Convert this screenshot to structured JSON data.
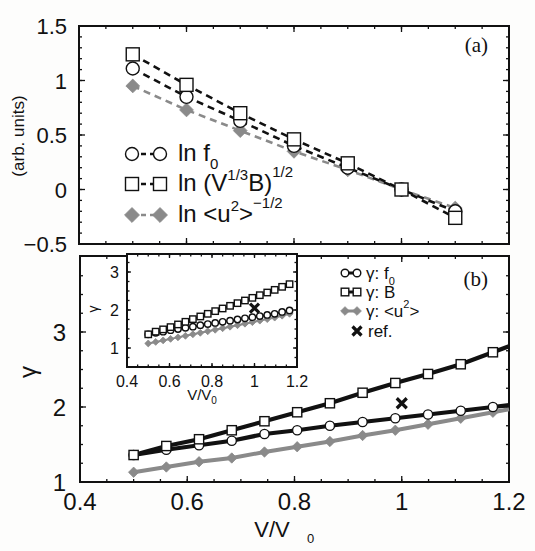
{
  "chart_data": [
    {
      "panel": "a",
      "type": "line",
      "panel_label": "(a)",
      "title": "",
      "xlabel": "",
      "ylabel": "(arb. units)",
      "xlim": [
        0.4,
        1.2
      ],
      "ylim": [
        -0.5,
        1.5
      ],
      "yticks": [
        -0.5,
        0,
        0.5,
        1,
        1.5
      ],
      "ytick_labels": [
        "−0.5",
        "0",
        "0.5",
        "1",
        "1.5"
      ],
      "xticks": [
        0.4,
        0.6,
        0.8,
        1.0,
        1.2
      ],
      "grid": false,
      "legend_position": "lower-left",
      "x": [
        0.5,
        0.6,
        0.7,
        0.8,
        0.9,
        1.0,
        1.1
      ],
      "series": [
        {
          "name": "ln f0",
          "legend": {
            "text": "ln f",
            "sub": "0",
            "sup": ""
          },
          "marker": "circle",
          "line": "dashed",
          "color": "#111111",
          "values": [
            1.11,
            0.85,
            0.63,
            0.4,
            0.2,
            0.0,
            -0.2
          ]
        },
        {
          "name": "ln (V^1/3 B)^1/2",
          "legend": {
            "text": "ln (V",
            "sup1": "1/3",
            "mid": "B)",
            "sup2": "1/2"
          },
          "marker": "square",
          "line": "dashed",
          "color": "#111111",
          "values": [
            1.24,
            0.96,
            0.7,
            0.46,
            0.24,
            0.0,
            -0.26
          ]
        },
        {
          "name": "ln <u^2>^-1/2",
          "legend": {
            "text": "ln <u",
            "sup1": "2",
            "mid": ">",
            "sup2": "−1/2"
          },
          "marker": "diamond",
          "line": "dashed",
          "color": "#8a8a8a",
          "values": [
            0.95,
            0.73,
            0.54,
            0.35,
            0.18,
            0.0,
            -0.17
          ]
        }
      ]
    },
    {
      "panel": "b",
      "type": "line",
      "panel_label": "(b)",
      "title": "",
      "xlabel": "V/V0",
      "xlabel_parts": {
        "main": "V/V",
        "sub": "0"
      },
      "ylabel": "γ",
      "xlim": [
        0.4,
        1.2
      ],
      "ylim": [
        1,
        4
      ],
      "xticks": [
        0.4,
        0.6,
        0.8,
        1,
        1.2
      ],
      "xtick_labels": [
        "0.4",
        "0.6",
        "0.8",
        "1",
        "1.2"
      ],
      "yticks": [
        1,
        2,
        3
      ],
      "ytick_labels": [
        "1",
        "2",
        "3"
      ],
      "grid": false,
      "legend_position": "upper-right",
      "x": [
        0.5,
        0.561,
        0.622,
        0.683,
        0.744,
        0.805,
        0.866,
        0.927,
        0.988,
        1.049,
        1.11,
        1.17
      ],
      "series": [
        {
          "name": "γ: f0",
          "legend": {
            "text": "γ: f",
            "sub": "0"
          },
          "marker": "circle",
          "line": "solid",
          "color": "#111111",
          "values": [
            1.36,
            1.43,
            1.49,
            1.55,
            1.64,
            1.69,
            1.75,
            1.8,
            1.85,
            1.9,
            1.95,
            2.0
          ]
        },
        {
          "name": "γ: B",
          "legend": {
            "text": "γ: B"
          },
          "marker": "square",
          "line": "solid",
          "color": "#111111",
          "values": [
            1.36,
            1.48,
            1.57,
            1.69,
            1.81,
            1.93,
            2.05,
            2.19,
            2.32,
            2.44,
            2.57,
            2.73
          ]
        },
        {
          "name": "γ: <u^2>",
          "legend": {
            "text": "γ: <u",
            "sup": "2",
            "tail": ">"
          },
          "marker": "diamond",
          "line": "solid",
          "color": "#8a8a8a",
          "values": [
            1.13,
            1.2,
            1.27,
            1.32,
            1.4,
            1.47,
            1.54,
            1.62,
            1.69,
            1.77,
            1.85,
            1.93
          ]
        }
      ],
      "reference_point": {
        "name": "ref.",
        "marker": "x",
        "x": 1.0,
        "y": 2.05
      },
      "line_extent_x": [
        0.5,
        1.2
      ]
    },
    {
      "panel": "b-inset",
      "type": "line",
      "xlabel": "V/V0",
      "xlabel_parts": {
        "main": "V/V",
        "sub": "0"
      },
      "ylabel": "γ",
      "xlim": [
        0.4,
        1.2
      ],
      "ylim": [
        0.5,
        3.5
      ],
      "xticks": [
        0.4,
        0.6,
        0.8,
        1,
        1.2
      ],
      "xtick_labels": [
        "0.4",
        "0.6",
        "0.8",
        "1",
        "1.2"
      ],
      "yticks": [
        1,
        2,
        3
      ],
      "ytick_labels": [
        "1",
        "2",
        "3"
      ],
      "x": [
        0.5,
        0.535,
        0.57,
        0.605,
        0.64,
        0.675,
        0.71,
        0.745,
        0.78,
        0.815,
        0.85,
        0.885,
        0.92,
        0.955,
        0.99,
        1.025,
        1.06,
        1.095,
        1.13,
        1.165
      ],
      "series": [
        {
          "name": "γ: f0",
          "marker": "circle",
          "color": "#111111",
          "values": [
            1.36,
            1.4,
            1.43,
            1.47,
            1.5,
            1.53,
            1.56,
            1.6,
            1.63,
            1.66,
            1.69,
            1.72,
            1.75,
            1.78,
            1.81,
            1.84,
            1.87,
            1.9,
            1.95,
            1.99
          ]
        },
        {
          "name": "γ: B",
          "marker": "square",
          "color": "#111111",
          "values": [
            1.36,
            1.43,
            1.49,
            1.55,
            1.62,
            1.69,
            1.76,
            1.83,
            1.9,
            1.97,
            2.04,
            2.11,
            2.18,
            2.25,
            2.32,
            2.39,
            2.46,
            2.53,
            2.61,
            2.68
          ]
        },
        {
          "name": "γ: <u^2>",
          "marker": "diamond",
          "color": "#8a8a8a",
          "values": [
            1.12,
            1.16,
            1.2,
            1.24,
            1.28,
            1.32,
            1.36,
            1.4,
            1.44,
            1.48,
            1.52,
            1.56,
            1.6,
            1.64,
            1.68,
            1.72,
            1.76,
            1.8,
            1.85,
            1.9
          ]
        }
      ],
      "reference_point": {
        "name": "ref.",
        "marker": "x",
        "x": 1.0,
        "y": 2.05
      }
    }
  ],
  "labels": {
    "panel_a": "(a)",
    "panel_b": "(b)",
    "ylabel_a": "(arb. units)",
    "ylabel_b": "γ",
    "xlabel_main": "V/V",
    "xlabel_sub": "0",
    "ref_label": "ref."
  },
  "colors": {
    "black": "#111111",
    "gray": "#8a8a8a",
    "background": "#fdfdfc"
  }
}
